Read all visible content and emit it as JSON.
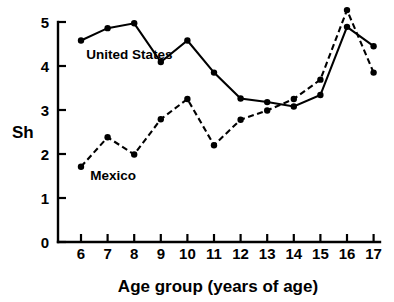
{
  "chart_data": {
    "type": "line",
    "title": "",
    "subtitle": "",
    "xlabel": "Age group (years of age)",
    "ylabel": "Sh",
    "x": [
      6,
      7,
      8,
      9,
      10,
      11,
      12,
      13,
      14,
      15,
      16,
      17
    ],
    "xticklabels": [
      "6",
      "7",
      "8",
      "9",
      "10",
      "11",
      "12",
      "13",
      "14",
      "15",
      "16",
      "17"
    ],
    "yticklabels": [
      "0",
      "1",
      "2",
      "3",
      "4",
      "5"
    ],
    "yticks": [
      0,
      1,
      2,
      3,
      4,
      5
    ],
    "xlim": [
      5.4,
      17.6
    ],
    "ylim": [
      0,
      5.45
    ],
    "grid": false,
    "legend": "inline-annotations",
    "series": [
      {
        "name": "United States",
        "linestyle": "solid",
        "marker": "filled-circle",
        "color": "#000000",
        "values": [
          4.58,
          4.86,
          4.97,
          4.09,
          4.58,
          3.85,
          3.26,
          3.18,
          3.08,
          3.34,
          4.89,
          4.45
        ]
      },
      {
        "name": "Mexico",
        "linestyle": "dashed",
        "marker": "filled-circle",
        "color": "#000000",
        "values": [
          1.71,
          2.38,
          1.99,
          2.79,
          3.25,
          2.2,
          2.78,
          2.99,
          3.25,
          3.69,
          5.27,
          3.85
        ]
      }
    ],
    "annotations": [
      {
        "text": "United States",
        "x": 6.2,
        "y": 4.15
      },
      {
        "text": "Mexico",
        "x": 6.35,
        "y": 1.42
      }
    ]
  },
  "axes": {
    "y_axis_label": "Sh",
    "x_axis_label": "Age group (years of age)"
  }
}
